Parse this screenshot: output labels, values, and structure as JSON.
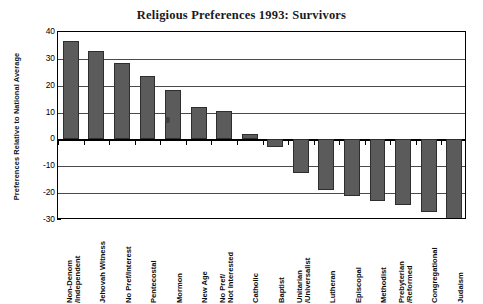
{
  "chart_data": {
    "type": "bar",
    "title": "Religious Preferences 1993: Survivors",
    "xlabel": "",
    "ylabel": "Preferences Relative to National Average",
    "ylim": [
      -30,
      40
    ],
    "ytick_values": [
      40,
      30,
      20,
      10,
      0,
      -10,
      -20,
      -30
    ],
    "ytick_labels": [
      "40",
      "30",
      "20",
      "10",
      "0",
      "-10",
      "-20",
      "-30"
    ],
    "grid": true,
    "legend": "none",
    "bar_color": "#5b5b5b",
    "categories": [
      "Non-Denom /Independent",
      "Jehovah Witness",
      "No Pref/Interest",
      "Pentecostal",
      "Mormon",
      "New Age",
      "No Pref/ Not Interested",
      "Catholic",
      "Baptist",
      "Unitarian /Universalist",
      "Lutheran",
      "Episcopal",
      "Methodist",
      "Prebyterian /Reformed",
      "Congregational",
      "Judaism"
    ],
    "category_lines": [
      [
        "Non-Denom",
        "/Independent"
      ],
      [
        "Jehovah Witness",
        ""
      ],
      [
        "No Pref/Interest",
        ""
      ],
      [
        "Pentecostal",
        ""
      ],
      [
        "Mormon",
        ""
      ],
      [
        "New Age",
        ""
      ],
      [
        "No Pref/",
        "Not Interested"
      ],
      [
        "Catholic",
        ""
      ],
      [
        "Baptist",
        ""
      ],
      [
        "Unitarian",
        "/Universalist"
      ],
      [
        "Lutheran",
        ""
      ],
      [
        "Episcopal",
        ""
      ],
      [
        "Methodist",
        ""
      ],
      [
        "Prebyterian",
        "/Reformed"
      ],
      [
        "Congregational",
        ""
      ],
      [
        "Judaism",
        ""
      ]
    ],
    "values": [
      36.5,
      33,
      28.5,
      23.5,
      18.5,
      12,
      10.5,
      2,
      -3,
      -12.5,
      -19,
      -21,
      -23,
      -24.5,
      -27,
      -30
    ]
  }
}
